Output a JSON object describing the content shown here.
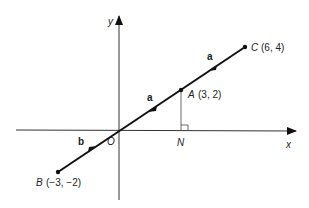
{
  "axes": {
    "x_label": "x",
    "y_label": "y",
    "origin_label": "O"
  },
  "points": {
    "A": {
      "name": "A",
      "coords": "(3, 2)"
    },
    "B": {
      "name": "B",
      "coords": "(−3, −2)"
    },
    "C": {
      "name": "C",
      "coords": "(6, 4)"
    },
    "N": {
      "name": "N"
    }
  },
  "vectors": {
    "a1": "a",
    "a2": "a",
    "b": "b"
  },
  "colors": {
    "line": "#111111",
    "background": "#ffffff"
  }
}
